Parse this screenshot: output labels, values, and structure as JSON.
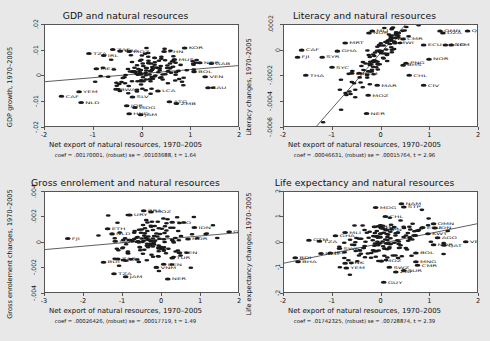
{
  "figure": {
    "background_color": "#e8e8e8",
    "panel_background_color": "#ffffff",
    "marker_color": "#1a1a1a"
  },
  "panels": [
    {
      "id": "gdp",
      "title": "GDP and natural resources",
      "ylabel": "GDP growth, 1970–2005",
      "xlabel": "Net export of natural resources, 1970–2005",
      "coef_text": "coef = .00170001, (robust) se = .00103688, t = 1.64",
      "yticks": [
        ".02",
        ".01",
        "0",
        "-.01",
        "-.02"
      ],
      "xticks": [
        "-2",
        "-1",
        "0",
        "1",
        "2"
      ],
      "ylim": [
        -0.025,
        0.025
      ],
      "xlim": [
        -2.35,
        2.35
      ],
      "fit": {
        "intercept": 0.0008,
        "slope": 0.00170001
      }
    },
    {
      "id": "literacy",
      "title": "Literacy and natural resources",
      "ylabel": "Literacy changes, 1970–2005",
      "xlabel": "Net export of natural resources, 1970–2005",
      "coef_text": "coef = .00046631, (robust) se = .00015764, t = 2.96",
      "yticks": [
        ".0002",
        "0",
        "-.0002",
        "-.0004",
        "-.0006"
      ],
      "xticks": [
        "-2",
        "-1",
        "0",
        "1",
        "2"
      ],
      "ylim": [
        -0.0007,
        0.0003
      ],
      "xlim": [
        -2.35,
        2.35
      ],
      "fit": {
        "intercept": 2e-05,
        "slope": 0.00046631
      }
    },
    {
      "id": "enrolment",
      "title": "Gross enrolement and natural resources",
      "ylabel": "Gross enrolement changes, 1970–2005",
      "xlabel": "Net export of natural resources, 1970–2005",
      "coef_text": "coef = .00026426, (robust) se = .00017719, t = 1.49",
      "yticks": [
        ".004",
        ".002",
        "0",
        "-.002",
        "-.004"
      ],
      "xticks": [
        "-3",
        "-2",
        "-1",
        "0",
        "1",
        "2"
      ],
      "ylim": [
        -0.0048,
        0.0048
      ],
      "xlim": [
        -3.4,
        2.7
      ],
      "fit": {
        "intercept": 0.0002,
        "slope": 0.00026426
      }
    },
    {
      "id": "lifeexp",
      "title": "Life expectancy and natural resources",
      "ylabel": "Life expectancy changes, 1970–2005",
      "xlabel": "Net export of natural resources, 1970–2005",
      "coef_text": "coef = .01742325, (robust) se = .00728874, t = 2.39",
      "yticks": [
        "2",
        "1",
        "0",
        "-1",
        "-2"
      ],
      "xticks": [
        "-2",
        "-1",
        "0",
        "1",
        "2"
      ],
      "ylim": [
        -2.45,
        2.45
      ],
      "xlim": [
        -2.4,
        2.4
      ],
      "fit": {
        "intercept": -0.06,
        "slope": 0.4
      }
    }
  ],
  "chart_data": [
    {
      "type": "scatter",
      "panel": "gdp",
      "title": "GDP and natural resources",
      "xlabel": "Net export of natural resources, 1970–2005",
      "ylabel": "GDP growth, 1970–2005",
      "xlim": [
        -2.35,
        2.35
      ],
      "ylim": [
        -0.025,
        0.025
      ],
      "grid": false,
      "annotation": "coef = .00170001, (robust) se = .00103688, t = 1.64",
      "fit_line": {
        "slope": 0.00170001,
        "intercept": 0.0008
      },
      "labeled_points": [
        {
          "label": "CAF",
          "x": -1.95,
          "y": -0.0105
        },
        {
          "label": "YEM",
          "x": -1.52,
          "y": -0.0082
        },
        {
          "label": "NLD",
          "x": -1.47,
          "y": -0.0135
        },
        {
          "label": "TZA",
          "x": -1.28,
          "y": 0.0108
        },
        {
          "label": "MEX",
          "x": -1.1,
          "y": 0.0032
        },
        {
          "label": "IRL",
          "x": -0.92,
          "y": 0.0098
        },
        {
          "label": "ZAF",
          "x": -0.7,
          "y": 0.0128
        },
        {
          "label": "BRA",
          "x": -0.52,
          "y": 0.012
        },
        {
          "label": "BWA",
          "x": -0.62,
          "y": -0.007
        },
        {
          "label": "MOZ",
          "x": -0.3,
          "y": 0.0118
        },
        {
          "label": "JOR",
          "x": -0.36,
          "y": -0.0152
        },
        {
          "label": "HND",
          "x": -0.3,
          "y": -0.0192
        },
        {
          "label": "SLV",
          "x": -0.22,
          "y": -0.0108
        },
        {
          "label": "MDG",
          "x": -0.16,
          "y": -0.016
        },
        {
          "label": "JAM",
          "x": -0.02,
          "y": -0.0196
        },
        {
          "label": "CHN",
          "x": 0.55,
          "y": 0.0118
        },
        {
          "label": "LCA",
          "x": 0.4,
          "y": -0.0078
        },
        {
          "label": "MUS",
          "x": 0.8,
          "y": 0.0078
        },
        {
          "label": "KOR",
          "x": 1.05,
          "y": 0.0135
        },
        {
          "label": "ATG",
          "x": 0.68,
          "y": -0.0132
        },
        {
          "label": "ZMB",
          "x": 0.85,
          "y": -0.014
        },
        {
          "label": "NOR",
          "x": 1.42,
          "y": 0.0062
        },
        {
          "label": "GAB",
          "x": 1.7,
          "y": 0.0058
        },
        {
          "label": "BOL",
          "x": 1.28,
          "y": 0.0018
        },
        {
          "label": "VEN",
          "x": 1.55,
          "y": -0.0008
        },
        {
          "label": "SAU",
          "x": 1.62,
          "y": -0.0062
        }
      ],
      "n_points": 150
    },
    {
      "type": "scatter",
      "panel": "literacy",
      "title": "Literacy and natural resources",
      "xlabel": "Net export of natural resources, 1970–2005",
      "ylabel": "Literacy changes, 1970–2005",
      "xlim": [
        -2.35,
        2.35
      ],
      "ylim": [
        -0.0007,
        0.0003
      ],
      "grid": false,
      "annotation": "coef = .00046631, (robust) se = .00015764, t = 2.96",
      "fit_line": {
        "slope": 0.00046631,
        "intercept": 2e-05
      },
      "labeled_points": [
        {
          "label": "CAF",
          "x": -1.92,
          "y": 5e-05
        },
        {
          "label": "FJI",
          "x": -2.02,
          "y": -2e-05
        },
        {
          "label": "THA",
          "x": -1.82,
          "y": -0.0002
        },
        {
          "label": "SYR",
          "x": -1.42,
          "y": -2e-05
        },
        {
          "label": "GHA",
          "x": -1.05,
          "y": 4e-05
        },
        {
          "label": "MRT",
          "x": -0.86,
          "y": 0.00012
        },
        {
          "label": "SYC",
          "x": -1.18,
          "y": -0.00012
        },
        {
          "label": "LBR",
          "x": -0.7,
          "y": -0.00018
        },
        {
          "label": "YEM",
          "x": -0.52,
          "y": -0.00018
        },
        {
          "label": "NOR",
          "x": -0.28,
          "y": 0.00022
        },
        {
          "label": "MLI",
          "x": -0.2,
          "y": 0.00024
        },
        {
          "label": "MAR",
          "x": -0.08,
          "y": -0.0003
        },
        {
          "label": "MOZ",
          "x": -0.3,
          "y": -0.0004
        },
        {
          "label": "NER",
          "x": -0.34,
          "y": -0.00058
        },
        {
          "label": "NIC",
          "x": 0.25,
          "y": 0.00016
        },
        {
          "label": "CMR",
          "x": 0.55,
          "y": 0.00016
        },
        {
          "label": "MWI",
          "x": 0.35,
          "y": 0.00012
        },
        {
          "label": "BHS",
          "x": 0.55,
          "y": -0.0001
        },
        {
          "label": "PNG",
          "x": 0.62,
          "y": -8e-05
        },
        {
          "label": "CHL",
          "x": 0.7,
          "y": -0.0002
        },
        {
          "label": "ECU",
          "x": 1.05,
          "y": 0.0001
        },
        {
          "label": "CIV",
          "x": 1.05,
          "y": -0.0003
        },
        {
          "label": "NOR",
          "x": 1.18,
          "y": -4e-05
        },
        {
          "label": "OMN",
          "x": 1.45,
          "y": 0.00024
        },
        {
          "label": "DZA",
          "x": 1.52,
          "y": 0.00022
        },
        {
          "label": "AGO",
          "x": 1.58,
          "y": 0.0001
        },
        {
          "label": "YEM",
          "x": 1.72,
          "y": 0.0001
        },
        {
          "label": "QAT",
          "x": 2.12,
          "y": 0.00024
        }
      ],
      "n_points": 150
    },
    {
      "type": "scatter",
      "panel": "enrolment",
      "title": "Gross enrolement and natural resources",
      "xlabel": "Net export of natural resources, 1970–2005",
      "ylabel": "Gross enrolement changes, 1970–2005",
      "xlim": [
        -3.4,
        2.7
      ],
      "ylim": [
        -0.0048,
        0.0048
      ],
      "grid": false,
      "annotation": "coef = .00026426, (robust) se = .00017719, t = 1.49",
      "fit_line": {
        "slope": 0.00026426,
        "intercept": 0.0002
      },
      "labeled_points": [
        {
          "label": "FJI",
          "x": -2.68,
          "y": 0.00035
        },
        {
          "label": "BDI",
          "x": -1.55,
          "y": -0.0019
        },
        {
          "label": "ETH",
          "x": -1.42,
          "y": 0.0013
        },
        {
          "label": "NLD",
          "x": -1.28,
          "y": 0.0008
        },
        {
          "label": "SWE",
          "x": -1.18,
          "y": 0.0001
        },
        {
          "label": "ZAR",
          "x": -1.1,
          "y": -0.0016
        },
        {
          "label": "JOR",
          "x": -0.92,
          "y": -0.0017
        },
        {
          "label": "BRA",
          "x": -0.28,
          "y": 0.003
        },
        {
          "label": "URY",
          "x": -0.72,
          "y": 0.0026
        },
        {
          "label": "MOZ",
          "x": -0.05,
          "y": 0.0029
        },
        {
          "label": "TZA",
          "x": -1.22,
          "y": -0.003
        },
        {
          "label": "JAM",
          "x": -0.85,
          "y": -0.0033
        },
        {
          "label": "VNM",
          "x": 0.12,
          "y": -0.0024
        },
        {
          "label": "BEN",
          "x": 0.35,
          "y": -0.0021
        },
        {
          "label": "NER",
          "x": 0.48,
          "y": -0.0035
        },
        {
          "label": "TUR",
          "x": 0.62,
          "y": -0.0015
        },
        {
          "label": "SEN",
          "x": 0.85,
          "y": -0.001
        },
        {
          "label": "TGO",
          "x": 0.62,
          "y": 0.0019
        },
        {
          "label": "IDN",
          "x": 1.32,
          "y": 0.0014
        },
        {
          "label": "NOR",
          "x": 1.12,
          "y": 0.0003
        },
        {
          "label": "GAB",
          "x": 2.42,
          "y": 0.001
        }
      ],
      "n_points": 150
    },
    {
      "type": "scatter",
      "panel": "lifeexp",
      "title": "Life expectancy and natural resources",
      "xlabel": "Net export of natural resources, 1970–2005",
      "ylabel": "Life expectancy changes, 1970–2005",
      "xlim": [
        -2.4,
        2.4
      ],
      "ylim": [
        -2.45,
        2.45
      ],
      "grid": false,
      "annotation": "coef = .01742325, (robust) se = .00728874, t = 2.39",
      "fit_line": {
        "slope": 0.4,
        "intercept": -0.06
      },
      "labeled_points": [
        {
          "label": "BDI",
          "x": -2.12,
          "y": -0.75
        },
        {
          "label": "BHA",
          "x": -2.05,
          "y": -0.95
        },
        {
          "label": "GTM",
          "x": -1.78,
          "y": 0.1
        },
        {
          "label": "TZA",
          "x": -1.52,
          "y": 0.05
        },
        {
          "label": "NLD",
          "x": -1.48,
          "y": -0.55
        },
        {
          "label": "IRL",
          "x": -1.25,
          "y": -0.52
        },
        {
          "label": "GHA",
          "x": -1.12,
          "y": 0.32
        },
        {
          "label": "MLI",
          "x": -0.88,
          "y": 0.48
        },
        {
          "label": "SWE",
          "x": -1.02,
          "y": -0.3
        },
        {
          "label": "DNK",
          "x": -0.88,
          "y": -1.02
        },
        {
          "label": "YEM",
          "x": -0.85,
          "y": -1.25
        },
        {
          "label": "MDG",
          "x": -0.12,
          "y": 1.7
        },
        {
          "label": "CHL",
          "x": 0.12,
          "y": 1.25
        },
        {
          "label": "CRI",
          "x": -0.15,
          "y": 0.75
        },
        {
          "label": "LKA",
          "x": 0.02,
          "y": 0.7
        },
        {
          "label": "JPN",
          "x": 0.15,
          "y": 0.6
        },
        {
          "label": "NAM",
          "x": 0.52,
          "y": 1.88
        },
        {
          "label": "STP",
          "x": 0.58,
          "y": 1.72
        },
        {
          "label": "MOZ",
          "x": 0.02,
          "y": -0.92
        },
        {
          "label": "SWZ",
          "x": 0.22,
          "y": -1.22
        },
        {
          "label": "ZAF",
          "x": 0.38,
          "y": -1.45
        },
        {
          "label": "SUR",
          "x": 0.58,
          "y": -1.38
        },
        {
          "label": "GUY",
          "x": 0.08,
          "y": -1.95
        },
        {
          "label": "MNG",
          "x": 0.88,
          "y": -0.95
        },
        {
          "label": "CMR",
          "x": 0.92,
          "y": -1.12
        },
        {
          "label": "BOL",
          "x": 0.88,
          "y": -0.52
        },
        {
          "label": "ECU",
          "x": 1.05,
          "y": 0.72
        },
        {
          "label": "OMN",
          "x": 1.32,
          "y": 0.9
        },
        {
          "label": "IDN",
          "x": 1.35,
          "y": 0.7
        },
        {
          "label": "KWT",
          "x": 1.18,
          "y": 0.42
        },
        {
          "label": "AGO",
          "x": 1.42,
          "y": 0.22
        },
        {
          "label": "NOR",
          "x": 1.32,
          "y": -0.12
        },
        {
          "label": "QAT",
          "x": 1.58,
          "y": -0.15
        },
        {
          "label": "VEN",
          "x": 2.12,
          "y": 0.02
        }
      ],
      "n_points": 150
    }
  ]
}
